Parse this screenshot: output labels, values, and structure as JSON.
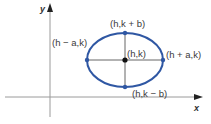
{
  "diagram": {
    "axes": {
      "x_label": "x",
      "y_label": "y"
    },
    "ellipse": {
      "center": {
        "label": "(h,k)"
      },
      "vertex_right": {
        "label": "(h + a,k)"
      },
      "vertex_left": {
        "label": "(h − a,k)"
      },
      "covertex_top": {
        "label": "(h,k + b)"
      },
      "covertex_bottom": {
        "label": "(h,k − b)"
      }
    },
    "colors": {
      "ellipse": "#2f57a3",
      "axes": "#8a8a8a",
      "inner_lines": "#555555",
      "center_dot": "#111111"
    }
  }
}
